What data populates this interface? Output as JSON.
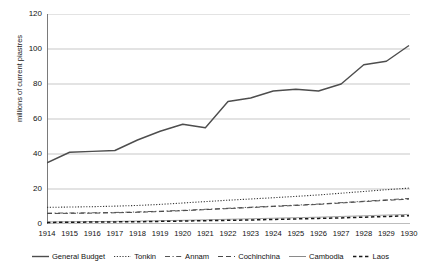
{
  "chart_data": {
    "type": "line",
    "title": "",
    "xlabel": "",
    "ylabel": "millions of current piastres",
    "ylim": [
      0,
      120
    ],
    "yticks": [
      0,
      20,
      40,
      60,
      80,
      100,
      120
    ],
    "grid": true,
    "legend_position": "bottom",
    "categories": [
      "1914",
      "1915",
      "1916",
      "1917",
      "1918",
      "1919",
      "1920",
      "1921",
      "1922",
      "1923",
      "1924",
      "1925",
      "1926",
      "1927",
      "1928",
      "1929",
      "1930"
    ],
    "series": [
      {
        "name": "General Budget",
        "style": "solid",
        "color": "#4d4d4d",
        "width": 1.4,
        "values": [
          35,
          41,
          41.5,
          42,
          48,
          53,
          57,
          55,
          70,
          72,
          76,
          77,
          76,
          80,
          91,
          93,
          102
        ]
      },
      {
        "name": "Tonkin",
        "style": "dotted",
        "color": "#3a3a3a",
        "width": 1.1,
        "values": [
          9.5,
          9.7,
          9.9,
          10.2,
          10.6,
          11.2,
          12.0,
          12.8,
          13.6,
          14.3,
          15.0,
          15.8,
          16.6,
          17.6,
          18.6,
          19.6,
          20.5
        ]
      },
      {
        "name": "Annam",
        "style": "dashdot",
        "color": "#555555",
        "width": 1.0,
        "values": [
          6.2,
          6.3,
          6.4,
          6.6,
          6.9,
          7.3,
          7.8,
          8.4,
          9.0,
          9.6,
          10.2,
          10.8,
          11.4,
          12.2,
          13.0,
          13.8,
          14.6
        ]
      },
      {
        "name": "Cochinchina",
        "style": "dashed",
        "color": "#4a4a4a",
        "width": 1.0,
        "values": [
          6.0,
          6.1,
          6.2,
          6.4,
          6.7,
          7.1,
          7.6,
          8.2,
          8.8,
          9.4,
          10.0,
          10.6,
          11.2,
          12.0,
          12.8,
          13.5,
          14.2
        ]
      },
      {
        "name": "Cambodia",
        "style": "solid",
        "color": "#8a8a8a",
        "width": 0.8,
        "values": [
          1.2,
          1.3,
          1.4,
          1.5,
          1.7,
          1.9,
          2.1,
          2.4,
          2.7,
          3.0,
          3.3,
          3.6,
          3.9,
          4.3,
          4.7,
          5.1,
          5.5
        ]
      },
      {
        "name": "Laos",
        "style": "dashed-bold",
        "color": "#1a1a1a",
        "width": 1.5,
        "values": [
          0.9,
          1.0,
          1.1,
          1.2,
          1.3,
          1.5,
          1.7,
          1.9,
          2.1,
          2.3,
          2.6,
          2.9,
          3.2,
          3.5,
          3.9,
          4.3,
          4.7
        ]
      }
    ]
  },
  "axis": {
    "y_title": "millions of current piastres"
  },
  "colors": {
    "grid": "#b9b9b9",
    "axis": "#7a7a7a",
    "background": "#ffffff"
  }
}
